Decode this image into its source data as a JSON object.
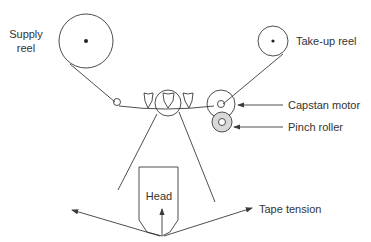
{
  "diagram": {
    "type": "tape transport mechanism",
    "labels": {
      "supply_reel_line1": "Supply",
      "supply_reel_line2": "reel",
      "takeup_reel": "Take-up reel",
      "capstan_motor": "Capstan motor",
      "pinch_roller": "Pinch roller",
      "head": "Head",
      "tape_tension": "Tape tension"
    },
    "colors": {
      "line": "#3a3a3a",
      "pinch_roller_fill": "#d9d9d9",
      "text": "#333333",
      "background": "#ffffff"
    }
  }
}
